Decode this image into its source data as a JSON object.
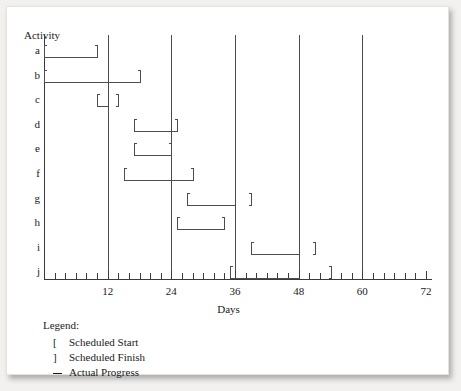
{
  "chart_data": {
    "type": "bar",
    "title": "",
    "xlabel": "Days",
    "ylabel": "Activity",
    "xlim": [
      0,
      72
    ],
    "x_tick_labels": [
      "12",
      "24",
      "36",
      "48",
      "60",
      "72"
    ],
    "x_tick_values": [
      12,
      24,
      36,
      48,
      60,
      72
    ],
    "x_minor_tick_step": 2,
    "gridlines": [
      12,
      24,
      36,
      48,
      60
    ],
    "grid": true,
    "legend_position": "below-axis-left",
    "categories": [
      "a",
      "b",
      "c",
      "d",
      "e",
      "f",
      "g",
      "h",
      "i",
      "j"
    ],
    "series": [
      {
        "name": "Scheduled Start",
        "values": [
          0,
          0,
          10,
          17,
          17,
          15,
          27,
          25,
          39,
          35
        ]
      },
      {
        "name": "Scheduled Finish",
        "values": [
          10,
          18,
          14,
          25,
          24,
          28,
          39,
          34,
          51,
          54
        ]
      },
      {
        "name": "Actual Progress",
        "values": [
          10,
          18,
          12,
          25,
          24,
          28,
          36,
          34,
          48,
          48
        ]
      }
    ],
    "rows": [
      {
        "activity": "a",
        "scheduled_start": 0,
        "scheduled_finish": 10,
        "actual_progress": 10
      },
      {
        "activity": "b",
        "scheduled_start": 0,
        "scheduled_finish": 18,
        "actual_progress": 18
      },
      {
        "activity": "c",
        "scheduled_start": 10,
        "scheduled_finish": 14,
        "actual_progress": 12
      },
      {
        "activity": "d",
        "scheduled_start": 17,
        "scheduled_finish": 25,
        "actual_progress": 25
      },
      {
        "activity": "e",
        "scheduled_start": 17,
        "scheduled_finish": 24,
        "actual_progress": 24
      },
      {
        "activity": "f",
        "scheduled_start": 15,
        "scheduled_finish": 28,
        "actual_progress": 28
      },
      {
        "activity": "g",
        "scheduled_start": 27,
        "scheduled_finish": 39,
        "actual_progress": 36
      },
      {
        "activity": "h",
        "scheduled_start": 25,
        "scheduled_finish": 34,
        "actual_progress": 34
      },
      {
        "activity": "i",
        "scheduled_start": 39,
        "scheduled_finish": 51,
        "actual_progress": 48
      },
      {
        "activity": "j",
        "scheduled_start": 35,
        "scheduled_finish": 54,
        "actual_progress": 48
      }
    ]
  },
  "axes": {
    "y_axis_title": "Activity",
    "x_axis_title": "Days"
  },
  "legend": {
    "title": "Legend:",
    "entries": [
      {
        "symbol": "[",
        "label": "Scheduled Start"
      },
      {
        "symbol": "]",
        "label": "Scheduled Finish"
      },
      {
        "symbol": "_",
        "label": "Actual Progress"
      }
    ]
  },
  "colors": {
    "ink": "#1a1a1a",
    "line": "#4d4d4d",
    "axis": "#3a3a3a",
    "paper": "#ffffff",
    "backdrop": "#f2f1ef"
  }
}
